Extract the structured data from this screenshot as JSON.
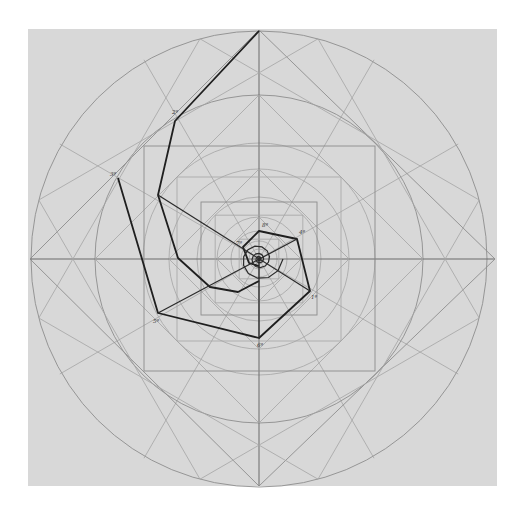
{
  "figure": {
    "kind": "geometric construction drawing",
    "colors": {
      "paper": "#d8d8d8",
      "guide_lines": "#8d8d8d",
      "spiral_lines": "#1f1f1f",
      "background": "#ffffff"
    },
    "frame": {
      "x": 28,
      "y": 29,
      "width": 469,
      "height": 457
    },
    "center": {
      "x": 259,
      "y": 259
    },
    "circle_radii": [
      228,
      164,
      116,
      90,
      62,
      42,
      28,
      18,
      10,
      5
    ],
    "squares": [
      {
        "name": "outer-diamond",
        "points": [
          [
            259,
            30
          ],
          [
            495,
            259
          ],
          [
            259,
            486
          ],
          [
            30,
            259
          ]
        ]
      },
      {
        "name": "large-square",
        "x": 144,
        "y": 146,
        "width": 231,
        "height": 225
      },
      {
        "name": "inner-square",
        "x": 201,
        "y": 202,
        "width": 116,
        "height": 113
      }
    ],
    "spiral_outer": [
      [
        259,
        31
      ],
      [
        175,
        121
      ],
      [
        158,
        195
      ],
      [
        178,
        258
      ],
      [
        210,
        287
      ],
      [
        238,
        292
      ],
      [
        259,
        281
      ]
    ],
    "spiral_second": [
      [
        118,
        178
      ],
      [
        158,
        313
      ],
      [
        259,
        338
      ],
      [
        310,
        291
      ],
      [
        297,
        239
      ],
      [
        259,
        231
      ],
      [
        243,
        247
      ],
      [
        249,
        263
      ],
      [
        259,
        266
      ]
    ],
    "spiral_inner": [
      [
        259,
        338
      ],
      [
        259,
        259
      ]
    ],
    "labels": [
      {
        "text": "2ª",
        "x": 172,
        "y": 114
      },
      {
        "text": "3ª",
        "x": 110,
        "y": 176
      },
      {
        "text": "5ª",
        "x": 153,
        "y": 323
      },
      {
        "text": "6ª",
        "x": 257,
        "y": 347
      },
      {
        "text": "1ª",
        "x": 311,
        "y": 299
      },
      {
        "text": "4ª",
        "x": 299,
        "y": 234
      },
      {
        "text": "8ª",
        "x": 262,
        "y": 227
      },
      {
        "text": "7ª",
        "x": 236,
        "y": 245
      }
    ]
  }
}
